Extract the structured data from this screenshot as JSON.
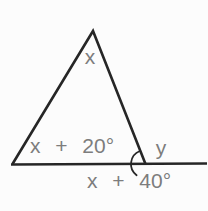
{
  "figure": {
    "labels": {
      "apex": "x",
      "base_left": "x + 20°",
      "exterior": "y",
      "below_line": "x + 40°"
    },
    "colors": {
      "stroke": "#262626",
      "label_text": "#7d7d7d",
      "background": "#fcfcfc"
    }
  }
}
